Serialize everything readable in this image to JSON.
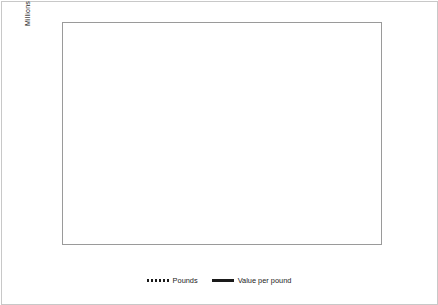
{
  "chart_data": {
    "type": "line",
    "title": "",
    "xlabel": "",
    "ylabel": "Millions",
    "y2label": "",
    "grid": true,
    "legend_position": "bottom",
    "x": [
      1815,
      1816,
      1817,
      1818,
      1819,
      1820,
      1821,
      1822,
      1823,
      1824,
      1825,
      1826,
      1827,
      1828,
      1829,
      1830,
      1831,
      1832,
      1833,
      1834,
      1835,
      1836,
      1837,
      1838,
      1839,
      1840,
      1841,
      1842,
      1843,
      1844,
      1845,
      1846,
      1847,
      1848,
      1849,
      1850
    ],
    "x_tick_labels": [
      "1815",
      "1817",
      "1819",
      "1821",
      "1823",
      "1825",
      "1827",
      "1829",
      "1831",
      "1833",
      "1835",
      "1837",
      "1839",
      "1841",
      "1843",
      "1845",
      "1847",
      "1849"
    ],
    "ylim": [
      0,
      1200
    ],
    "y_ticks": [
      0,
      200,
      400,
      600,
      800,
      1000,
      1200
    ],
    "y_tick_labels": [
      "0",
      "200",
      "400",
      "600",
      "800",
      "1000",
      "1200"
    ],
    "y2lim": [
      0.0,
      0.4
    ],
    "y2_ticks": [
      0.0,
      0.05,
      0.1,
      0.15,
      0.2,
      0.25,
      0.3,
      0.35,
      0.4
    ],
    "y2_tick_labels": [
      "$0.00",
      "$0.05",
      "$0.10",
      "$0.15",
      "$0.20",
      "$0.25",
      "$0.30",
      "$0.35",
      "$0.40"
    ],
    "series": [
      {
        "name": "Pounds",
        "style": "dotted",
        "axis": "right",
        "color": "#1a1a1a",
        "values": [
          0.027,
          0.026,
          0.026,
          0.027,
          0.027,
          0.028,
          0.028,
          0.029,
          0.04,
          0.043,
          0.04,
          0.046,
          0.05,
          0.06,
          0.05,
          0.054,
          0.066,
          0.072,
          0.078,
          0.083,
          0.09,
          0.12,
          0.138,
          0.155,
          0.2,
          0.185,
          0.145,
          0.17,
          0.21,
          0.25,
          0.2,
          0.185,
          0.215,
          0.29,
          0.345,
          0.215
        ]
      },
      {
        "name": "Value per pound",
        "style": "solid",
        "axis": "left",
        "color": "#1a1a1a",
        "values": [
          640,
          880,
          795,
          1015,
          800,
          600,
          525,
          535,
          440,
          630,
          405,
          310,
          300,
          305,
          295,
          300,
          330,
          400,
          440,
          510,
          515,
          470,
          400,
          295,
          420,
          250,
          265,
          265,
          230,
          205,
          275,
          210,
          230,
          225,
          205,
          340
        ]
      }
    ]
  },
  "legend": {
    "entries": [
      {
        "label": "Pounds"
      },
      {
        "label": "Value per pound"
      }
    ]
  }
}
